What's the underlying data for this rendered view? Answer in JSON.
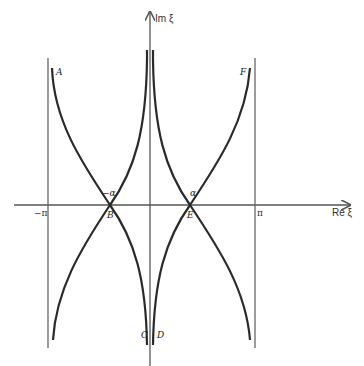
{
  "figure": {
    "axes": {
      "x_label": "Re ξ",
      "y_label": "Im ξ",
      "tick_neg_pi": "−π",
      "tick_pi": "π"
    },
    "points": {
      "A": "A",
      "B": "B",
      "C": "C",
      "D": "D",
      "E": "E",
      "F": "F",
      "neg_alpha": "−α",
      "alpha": "α"
    },
    "colors": {
      "curve": "#2a2a2a",
      "axis": "#555555",
      "background": "#ffffff"
    }
  }
}
